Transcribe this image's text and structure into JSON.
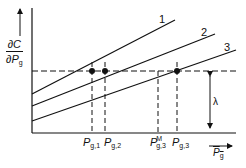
{
  "diagram": {
    "y_axis_label": {
      "numerator": "∂C",
      "denominator": "∂P",
      "denominator_sub": "g"
    },
    "x_axis_label": {
      "text": "P",
      "sub": "g"
    },
    "lambda_label": "λ",
    "lines": [
      {
        "id": "1",
        "label": "1"
      },
      {
        "id": "2",
        "label": "2"
      },
      {
        "id": "3",
        "label": "3"
      }
    ],
    "x_ticks": [
      {
        "main": "P",
        "sub": "g,1",
        "sup": ""
      },
      {
        "main": "P",
        "sub": "g,2",
        "sup": ""
      },
      {
        "main": "P",
        "sub": "g,3",
        "sup": "M"
      },
      {
        "main": "P",
        "sub": "g,3",
        "sup": ""
      }
    ],
    "colors": {
      "ink": "#111111",
      "background": "#ffffff"
    }
  }
}
